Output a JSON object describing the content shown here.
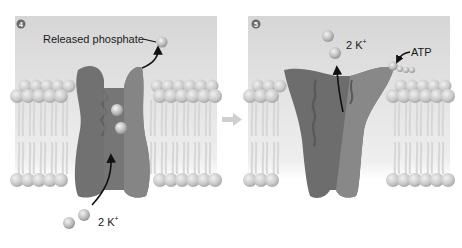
{
  "diagram": {
    "panels": [
      {
        "step": "4",
        "labels": {
          "released_phosphate": "Released phosphate",
          "ions_bottom": "2 K",
          "ions_bottom_charge": "+"
        }
      },
      {
        "step": "5",
        "labels": {
          "ions_top": "2 K",
          "ions_top_charge": "+",
          "atp": "ATP"
        }
      }
    ],
    "colors": {
      "extracellular_bg": "#dcdcdc",
      "protein_dark": "#6e6e6e",
      "protein_light": "#8c8c8c",
      "lipid_head": "#c4c4c4",
      "ion": "#b5b5b5",
      "arrow": "#111111",
      "step_badge": "#6a6a6a",
      "between_arrow": "#c8c8c8"
    }
  }
}
